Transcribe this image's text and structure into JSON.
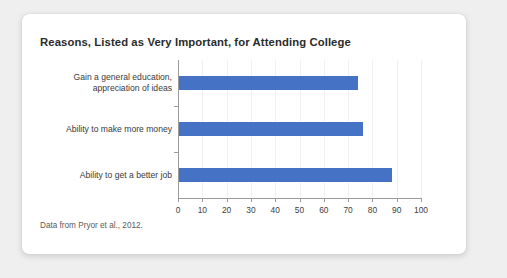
{
  "card": {
    "title": "Reasons, Listed as Very Important, for Attending College",
    "source_note": "Data from Pryor et al., 2012."
  },
  "chart_data": {
    "type": "bar",
    "orientation": "horizontal",
    "title": "Reasons, Listed as Very Important, for Attending College",
    "subtitle": "",
    "categories": [
      "Gain a general education,\nappreciation of ideas",
      "Ability to make more money",
      "Ability to get a better job"
    ],
    "category_lines": [
      [
        "Gain a general education,",
        "appreciation of ideas"
      ],
      [
        "Ability to make more money"
      ],
      [
        "Ability to get a better job"
      ]
    ],
    "values": [
      74,
      76,
      88
    ],
    "xlabel": "",
    "ylabel": "",
    "xlim": [
      0,
      100
    ],
    "xticks": [
      0,
      10,
      20,
      30,
      40,
      50,
      60,
      70,
      80,
      90,
      100
    ],
    "xtick_labels": [
      "0",
      "10",
      "20",
      "30",
      "40",
      "50",
      "60",
      "70",
      "80",
      "90",
      "100"
    ],
    "grid": true,
    "grid_axis": "x",
    "legend": false,
    "bar_color": "#4572C4",
    "annotation": "Data from Pryor et al., 2012."
  },
  "colors": {
    "page_background": "#EFEFEF",
    "card_background": "#FFFFFF",
    "bar": "#4572C4",
    "axis": "#9B9B9B",
    "grid": "#F0F0F0",
    "title_text": "#2B2B2B",
    "label_text": "#3A3A3A",
    "note_text": "#5A5A5A"
  }
}
